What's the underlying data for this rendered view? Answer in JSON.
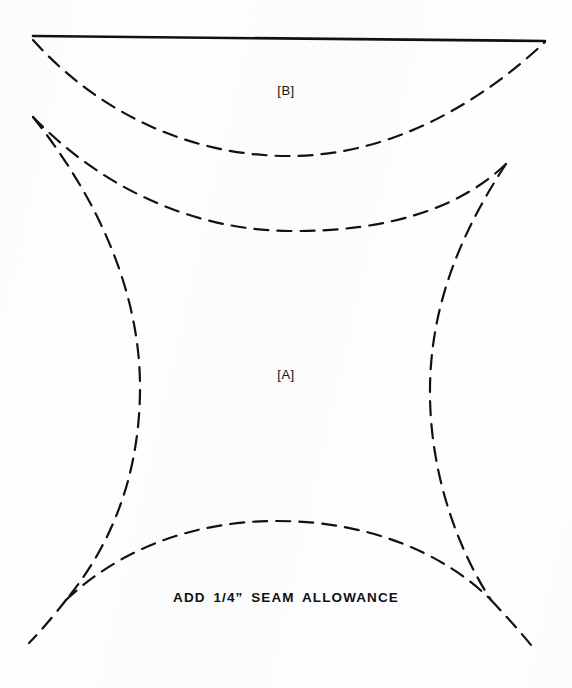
{
  "page": {
    "background_color": "#fefefe",
    "ink_color": "#111111",
    "width": 572,
    "height": 688,
    "document_type": "scanned sewing pattern diagram"
  },
  "labels": {
    "piece_b": "[B]",
    "piece_a": "[A]",
    "seam_note": "ADD 1/4” SEAM ALLOWANCE"
  },
  "geometry": {
    "stroke_color": "#111111",
    "solid_stroke_width": 2.6,
    "dashed_stroke_width": 2.2,
    "dash_pattern": "14 9",
    "shapes": [
      {
        "name": "top-solid-edge",
        "style": "solid",
        "d": "M 33 36 L 545 41"
      },
      {
        "name": "piece-b-lower-curve",
        "style": "dashed",
        "d": "M 33 40 C 96 110, 185 155, 286 156 C 390 157, 480 103, 545 42"
      },
      {
        "name": "piece-b-inner-curve",
        "style": "dashed",
        "d": "M 33 117 C 100 186, 190 230, 289 231 C 388 232, 460 208, 506 164"
      },
      {
        "name": "piece-a-left-side",
        "style": "dashed",
        "d": "M 33 117 C 103 205, 141 299, 140 391 C 139 487, 104 554, 66 600"
      },
      {
        "name": "piece-a-right-side",
        "style": "dashed",
        "d": "M 506 164 C 456 240, 429 314, 430 396 C 431 482, 462 556, 491 600"
      },
      {
        "name": "piece-a-bottom-curve",
        "style": "dashed",
        "d": "M 66 600 C 120 549, 193 521, 277 521 C 370 521, 445 554, 491 600"
      },
      {
        "name": "corner-tail-bottom-left",
        "style": "dashed",
        "d": "M 66 600 C 55 614, 42 630, 29 643"
      },
      {
        "name": "corner-tail-bottom-right",
        "style": "dashed",
        "d": "M 491 600 C 503 613, 518 629, 531 645"
      }
    ]
  }
}
